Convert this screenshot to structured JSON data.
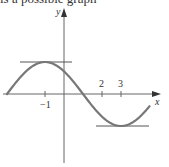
{
  "caption": "is a possible graph",
  "axes": {
    "x_label": "x",
    "y_label": "y",
    "origin_px": [
      64,
      94
    ],
    "unit_px": 19,
    "amplitude_px": 32
  },
  "ticks": {
    "neg1": "−1",
    "two": "2",
    "three": "3"
  },
  "curve": {
    "description": "sinusoid with maximum at x=-1, zero at x=1, minimum at x=3",
    "max_x": -1,
    "min_x": 3,
    "domain": [
      -3,
      4.5
    ],
    "color": "#777777"
  },
  "tangent_lines": [
    {
      "name": "horizontal-tangent-at-max",
      "at_x": -1
    },
    {
      "name": "horizontal-tangent-at-min",
      "at_x": 3
    }
  ]
}
